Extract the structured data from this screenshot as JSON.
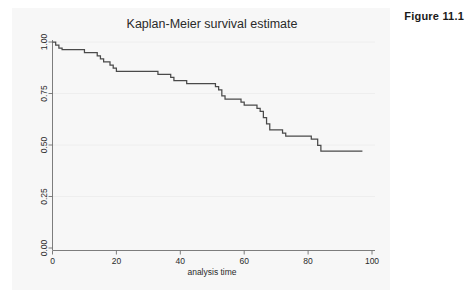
{
  "figure": {
    "label": "Figure 11.1"
  },
  "chart_data": {
    "type": "line",
    "subtype": "step",
    "title": "Kaplan-Meier survival estimate",
    "xlabel": "analysis time",
    "ylabel": "",
    "xlim": [
      0,
      100
    ],
    "ylim": [
      0.0,
      1.0
    ],
    "xticks": [
      0,
      20,
      40,
      60,
      80,
      100
    ],
    "xticklabels": [
      "0",
      "20",
      "40",
      "60",
      "80",
      "100"
    ],
    "yticks": [
      0.0,
      0.25,
      0.5,
      0.75,
      1.0
    ],
    "yticklabels": [
      "0.00",
      "0.25",
      "0.50",
      "0.75",
      "1.00"
    ],
    "grid": "horizontal",
    "legend": "none",
    "series": [
      {
        "name": "Kaplan-Meier survival estimate",
        "color": "#4a4a4a",
        "x": [
          0,
          1,
          2,
          3,
          9,
          10,
          13,
          14,
          15,
          16,
          17,
          18,
          19,
          20,
          32,
          33,
          36,
          37,
          38,
          41,
          42,
          50,
          51,
          52,
          53,
          54,
          58,
          59,
          60,
          63,
          64,
          65,
          66,
          67,
          68,
          71,
          72,
          73,
          80,
          81,
          83,
          84,
          97
        ],
        "y": [
          1.0,
          0.985,
          0.97,
          0.963,
          0.963,
          0.948,
          0.948,
          0.933,
          0.918,
          0.903,
          0.903,
          0.888,
          0.873,
          0.858,
          0.858,
          0.843,
          0.843,
          0.828,
          0.813,
          0.813,
          0.798,
          0.798,
          0.783,
          0.768,
          0.738,
          0.723,
          0.723,
          0.708,
          0.693,
          0.693,
          0.678,
          0.663,
          0.633,
          0.603,
          0.573,
          0.573,
          0.558,
          0.543,
          0.543,
          0.528,
          0.498,
          0.47,
          0.47
        ]
      }
    ]
  }
}
